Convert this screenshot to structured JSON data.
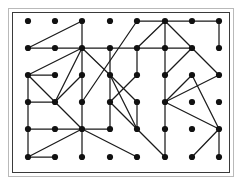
{
  "figure": {
    "kind": "graph-diagram",
    "title": "",
    "background_color": "#ffffff",
    "outer_frame_color": "#b9b9b9",
    "plot_border_color": "#3a3a3a",
    "node_color": "#111111",
    "edge_color": "#1a1a1a",
    "node_radius": 3.1,
    "edge_width": 1.25
  },
  "chart_data": {
    "type": "scatter",
    "title": "",
    "xlabel": "",
    "ylabel": "",
    "grid": false,
    "legend": "none",
    "rows": 6,
    "cols": 8,
    "node_count": 48,
    "edge_count": 61,
    "columns_x": [
      28,
      55,
      82,
      110,
      137,
      165,
      192,
      219
    ],
    "rows_y": [
      21,
      48,
      75,
      102,
      129,
      157
    ],
    "nodes": [
      {
        "id": "r0c0",
        "x": 28,
        "y": 21
      },
      {
        "id": "r0c1",
        "x": 55,
        "y": 21
      },
      {
        "id": "r0c2",
        "x": 82,
        "y": 21
      },
      {
        "id": "r0c3",
        "x": 110,
        "y": 21
      },
      {
        "id": "r0c4",
        "x": 137,
        "y": 21
      },
      {
        "id": "r0c5",
        "x": 165,
        "y": 21
      },
      {
        "id": "r0c6",
        "x": 192,
        "y": 21
      },
      {
        "id": "r0c7",
        "x": 219,
        "y": 21
      },
      {
        "id": "r1c0",
        "x": 28,
        "y": 48
      },
      {
        "id": "r1c1",
        "x": 55,
        "y": 48
      },
      {
        "id": "r1c2",
        "x": 82,
        "y": 48
      },
      {
        "id": "r1c3",
        "x": 110,
        "y": 48
      },
      {
        "id": "r1c4",
        "x": 137,
        "y": 48
      },
      {
        "id": "r1c5",
        "x": 165,
        "y": 48
      },
      {
        "id": "r1c6",
        "x": 192,
        "y": 48
      },
      {
        "id": "r1c7",
        "x": 219,
        "y": 48
      },
      {
        "id": "r2c0",
        "x": 28,
        "y": 75
      },
      {
        "id": "r2c1",
        "x": 55,
        "y": 75
      },
      {
        "id": "r2c2",
        "x": 82,
        "y": 75
      },
      {
        "id": "r2c3",
        "x": 110,
        "y": 75
      },
      {
        "id": "r2c4",
        "x": 137,
        "y": 75
      },
      {
        "id": "r2c5",
        "x": 165,
        "y": 75
      },
      {
        "id": "r2c6",
        "x": 192,
        "y": 75
      },
      {
        "id": "r2c7",
        "x": 219,
        "y": 75
      },
      {
        "id": "r3c0",
        "x": 28,
        "y": 102
      },
      {
        "id": "r3c1",
        "x": 55,
        "y": 102
      },
      {
        "id": "r3c2",
        "x": 82,
        "y": 102
      },
      {
        "id": "r3c3",
        "x": 110,
        "y": 102
      },
      {
        "id": "r3c4",
        "x": 137,
        "y": 102
      },
      {
        "id": "r3c5",
        "x": 165,
        "y": 102
      },
      {
        "id": "r3c6",
        "x": 192,
        "y": 102
      },
      {
        "id": "r3c7",
        "x": 219,
        "y": 102
      },
      {
        "id": "r4c0",
        "x": 28,
        "y": 129
      },
      {
        "id": "r4c1",
        "x": 55,
        "y": 129
      },
      {
        "id": "r4c2",
        "x": 82,
        "y": 129
      },
      {
        "id": "r4c3",
        "x": 110,
        "y": 129
      },
      {
        "id": "r4c4",
        "x": 137,
        "y": 129
      },
      {
        "id": "r4c5",
        "x": 165,
        "y": 129
      },
      {
        "id": "r4c6",
        "x": 192,
        "y": 129
      },
      {
        "id": "r4c7",
        "x": 219,
        "y": 129
      },
      {
        "id": "r5c0",
        "x": 28,
        "y": 157
      },
      {
        "id": "r5c1",
        "x": 55,
        "y": 157
      },
      {
        "id": "r5c2",
        "x": 82,
        "y": 157
      },
      {
        "id": "r5c3",
        "x": 110,
        "y": 157
      },
      {
        "id": "r5c4",
        "x": 137,
        "y": 157
      },
      {
        "id": "r5c5",
        "x": 165,
        "y": 157
      },
      {
        "id": "r5c6",
        "x": 192,
        "y": 157
      },
      {
        "id": "r5c7",
        "x": 219,
        "y": 157
      }
    ],
    "edges": [
      [
        "r0c2",
        "r1c0"
      ],
      [
        "r0c2",
        "r1c2"
      ],
      [
        "r1c0",
        "r1c1"
      ],
      [
        "r1c1",
        "r1c2"
      ],
      [
        "r1c2",
        "r1c3"
      ],
      [
        "r1c2",
        "r2c0"
      ],
      [
        "r1c2",
        "r2c2"
      ],
      [
        "r1c2",
        "r2c3"
      ],
      [
        "r1c2",
        "r3c1"
      ],
      [
        "r2c0",
        "r2c1"
      ],
      [
        "r2c0",
        "r3c0"
      ],
      [
        "r2c0",
        "r3c1"
      ],
      [
        "r3c1",
        "r2c2"
      ],
      [
        "r3c0",
        "r3c1"
      ],
      [
        "r3c0",
        "r4c0"
      ],
      [
        "r3c1",
        "r4c2"
      ],
      [
        "r4c0",
        "r4c1"
      ],
      [
        "r4c1",
        "r4c2"
      ],
      [
        "r4c0",
        "r5c0"
      ],
      [
        "r5c0",
        "r5c1"
      ],
      [
        "r5c0",
        "r4c2"
      ],
      [
        "r5c0",
        "r4c2b"
      ],
      [
        "r4c2",
        "r3c2"
      ],
      [
        "r3c2",
        "r2c2"
      ],
      [
        "r2c2",
        "r2c2v"
      ],
      [
        "r4c2",
        "r5c2"
      ],
      [
        "r4c2",
        "r4c3"
      ],
      [
        "r4c3",
        "r3c3"
      ],
      [
        "r3c3",
        "r2c3"
      ],
      [
        "r2c3",
        "r1c3"
      ],
      [
        "r4c2",
        "r5c4"
      ],
      [
        "r0c4",
        "r3c2"
      ],
      [
        "r0c4",
        "r0c5"
      ],
      [
        "r0c5",
        "r1c5"
      ],
      [
        "r1c5",
        "r2c5"
      ],
      [
        "r2c5",
        "r3c5"
      ],
      [
        "r3c5",
        "r4c5"
      ],
      [
        "r4c5",
        "r5c5"
      ],
      [
        "r0c5",
        "r1c4"
      ],
      [
        "r1c4",
        "r1c5"
      ],
      [
        "r1c3",
        "r1c4"
      ],
      [
        "r1c4",
        "r2c4"
      ],
      [
        "r0c5",
        "r0c6"
      ],
      [
        "r0c6",
        "r0c7"
      ],
      [
        "r0c7",
        "r1c7"
      ],
      [
        "r0c5",
        "r1c6"
      ],
      [
        "r1c5",
        "r1c6"
      ],
      [
        "r1c6",
        "r2c5"
      ],
      [
        "r1c6",
        "r2c7"
      ],
      [
        "r2c7",
        "r3c5"
      ],
      [
        "r3c5",
        "r2c6"
      ],
      [
        "r2c6",
        "r4c7"
      ],
      [
        "r3c5",
        "r4c7"
      ],
      [
        "r4c7",
        "r5c7"
      ],
      [
        "r4c7",
        "r5c6"
      ],
      [
        "r2c3",
        "r4c4"
      ],
      [
        "r4c4",
        "r5c5"
      ],
      [
        "r3c3",
        "r4c4"
      ],
      [
        "r2c4",
        "r3c3"
      ],
      [
        "r2c3",
        "r3c4"
      ],
      [
        "r3c4",
        "r4c4"
      ]
    ]
  }
}
